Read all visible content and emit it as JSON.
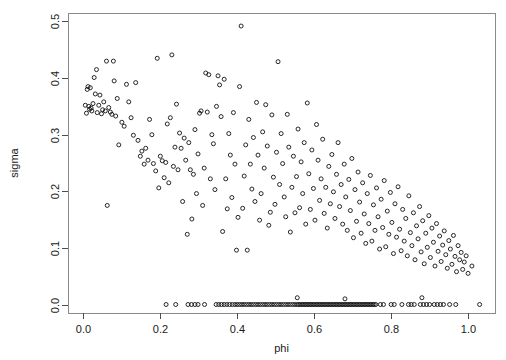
{
  "chart_data": {
    "type": "scatter",
    "title": "",
    "xlabel": "phi",
    "ylabel": "sigma",
    "xlim": [
      -0.04,
      1.07
    ],
    "ylim": [
      -0.015,
      0.515
    ],
    "xticks": [
      0.0,
      0.2,
      0.4,
      0.6,
      0.8,
      1.0
    ],
    "xtick_labels": [
      "0.0",
      "0.2",
      "0.4",
      "0.6",
      "0.8",
      "1.0"
    ],
    "yticks": [
      0.0,
      0.1,
      0.2,
      0.3,
      0.4,
      0.5
    ],
    "ytick_labels": [
      "0.0",
      "0.1",
      "0.2",
      "0.3",
      "0.4",
      "0.5"
    ],
    "grid": false,
    "legend": false,
    "marker": "open-circle",
    "marker_size": 4,
    "marker_color": "#111111",
    "n_points": 452,
    "points": [
      [
        0.005,
        0.352
      ],
      [
        0.008,
        0.338
      ],
      [
        0.01,
        0.38
      ],
      [
        0.012,
        0.385
      ],
      [
        0.014,
        0.35
      ],
      [
        0.016,
        0.345
      ],
      [
        0.018,
        0.383
      ],
      [
        0.02,
        0.347
      ],
      [
        0.022,
        0.342
      ],
      [
        0.025,
        0.355
      ],
      [
        0.028,
        0.401
      ],
      [
        0.031,
        0.372
      ],
      [
        0.034,
        0.415
      ],
      [
        0.036,
        0.339
      ],
      [
        0.04,
        0.352
      ],
      [
        0.043,
        0.37
      ],
      [
        0.047,
        0.337
      ],
      [
        0.05,
        0.344
      ],
      [
        0.053,
        0.358
      ],
      [
        0.057,
        0.342
      ],
      [
        0.06,
        0.43
      ],
      [
        0.062,
        0.175
      ],
      [
        0.066,
        0.348
      ],
      [
        0.07,
        0.34
      ],
      [
        0.074,
        0.336
      ],
      [
        0.078,
        0.43
      ],
      [
        0.08,
        0.395
      ],
      [
        0.084,
        0.333
      ],
      [
        0.088,
        0.364
      ],
      [
        0.092,
        0.282
      ],
      [
        0.1,
        0.322
      ],
      [
        0.106,
        0.315
      ],
      [
        0.112,
        0.389
      ],
      [
        0.118,
        0.358
      ],
      [
        0.124,
        0.33
      ],
      [
        0.13,
        0.299
      ],
      [
        0.136,
        0.392
      ],
      [
        0.142,
        0.29
      ],
      [
        0.148,
        0.262
      ],
      [
        0.152,
        0.271
      ],
      [
        0.158,
        0.248
      ],
      [
        0.162,
        0.276
      ],
      [
        0.168,
        0.255
      ],
      [
        0.172,
        0.327
      ],
      [
        0.178,
        0.3
      ],
      [
        0.182,
        0.249
      ],
      [
        0.188,
        0.236
      ],
      [
        0.192,
        0.435
      ],
      [
        0.196,
        0.206
      ],
      [
        0.2,
        0.262
      ],
      [
        0.205,
        0.254
      ],
      [
        0.21,
        0.224
      ],
      [
        0.214,
        0.251
      ],
      [
        0.218,
        0.319
      ],
      [
        0.222,
        0.215
      ],
      [
        0.226,
        0.33
      ],
      [
        0.23,
        0.441
      ],
      [
        0.234,
        0.244
      ],
      [
        0.238,
        0.278
      ],
      [
        0.242,
        0.354
      ],
      [
        0.246,
        0.238
      ],
      [
        0.25,
        0.303
      ],
      [
        0.254,
        0.276
      ],
      [
        0.258,
        0.182
      ],
      [
        0.262,
        0.294
      ],
      [
        0.266,
        0.255
      ],
      [
        0.27,
        0.124
      ],
      [
        0.274,
        0.286
      ],
      [
        0.278,
        0.238
      ],
      [
        0.282,
        0.151
      ],
      [
        0.286,
        0.23
      ],
      [
        0.29,
        0.309
      ],
      [
        0.294,
        0.196
      ],
      [
        0.298,
        0.266
      ],
      [
        0.302,
        0.338
      ],
      [
        0.306,
        0.342
      ],
      [
        0.31,
        0.175
      ],
      [
        0.314,
        0.241
      ],
      [
        0.318,
        0.409
      ],
      [
        0.322,
        0.34
      ],
      [
        0.326,
        0.406
      ],
      [
        0.33,
        0.222
      ],
      [
        0.334,
        0.3
      ],
      [
        0.338,
        0.284
      ],
      [
        0.342,
        0.203
      ],
      [
        0.346,
        0.35
      ],
      [
        0.35,
        0.404
      ],
      [
        0.354,
        0.388
      ],
      [
        0.358,
        0.332
      ],
      [
        0.362,
        0.129
      ],
      [
        0.366,
        0.398
      ],
      [
        0.37,
        0.222
      ],
      [
        0.374,
        0.169
      ],
      [
        0.378,
        0.302
      ],
      [
        0.382,
        0.264
      ],
      [
        0.386,
        0.189
      ],
      [
        0.39,
        0.339
      ],
      [
        0.394,
        0.248
      ],
      [
        0.398,
        0.096
      ],
      [
        0.402,
        0.154
      ],
      [
        0.406,
        0.385
      ],
      [
        0.41,
        0.492
      ],
      [
        0.414,
        0.17
      ],
      [
        0.418,
        0.227
      ],
      [
        0.422,
        0.282
      ],
      [
        0.426,
        0.096
      ],
      [
        0.43,
        0.327
      ],
      [
        0.434,
        0.248
      ],
      [
        0.438,
        0.204
      ],
      [
        0.442,
        0.295
      ],
      [
        0.446,
        0.182
      ],
      [
        0.45,
        0.357
      ],
      [
        0.454,
        0.264
      ],
      [
        0.458,
        0.149
      ],
      [
        0.462,
        0.196
      ],
      [
        0.466,
        0.305
      ],
      [
        0.47,
        0.241
      ],
      [
        0.474,
        0.353
      ],
      [
        0.478,
        0.28
      ],
      [
        0.482,
        0.14
      ],
      [
        0.486,
        0.163
      ],
      [
        0.49,
        0.335
      ],
      [
        0.494,
        0.225
      ],
      [
        0.498,
        0.177
      ],
      [
        0.502,
        0.269
      ],
      [
        0.506,
        0.429
      ],
      [
        0.51,
        0.212
      ],
      [
        0.514,
        0.302
      ],
      [
        0.518,
        0.249
      ],
      [
        0.522,
        0.19
      ],
      [
        0.526,
        0.155
      ],
      [
        0.53,
        0.336
      ],
      [
        0.534,
        0.278
      ],
      [
        0.538,
        0.128
      ],
      [
        0.542,
        0.207
      ],
      [
        0.546,
        0.262
      ],
      [
        0.55,
        0.162
      ],
      [
        0.554,
        0.226
      ],
      [
        0.558,
        0.31
      ],
      [
        0.562,
        0.171
      ],
      [
        0.566,
        0.252
      ],
      [
        0.57,
        0.196
      ],
      [
        0.574,
        0.286
      ],
      [
        0.578,
        0.142
      ],
      [
        0.582,
        0.356
      ],
      [
        0.586,
        0.231
      ],
      [
        0.59,
        0.168
      ],
      [
        0.594,
        0.273
      ],
      [
        0.598,
        0.205
      ],
      [
        0.602,
        0.149
      ],
      [
        0.606,
        0.318
      ],
      [
        0.61,
        0.255
      ],
      [
        0.614,
        0.184
      ],
      [
        0.618,
        0.222
      ],
      [
        0.622,
        0.292
      ],
      [
        0.626,
        0.161
      ],
      [
        0.63,
        0.207
      ],
      [
        0.634,
        0.135
      ],
      [
        0.638,
        0.244
      ],
      [
        0.642,
        0.178
      ],
      [
        0.646,
        0.265
      ],
      [
        0.65,
        0.199
      ],
      [
        0.654,
        0.152
      ],
      [
        0.658,
        0.23
      ],
      [
        0.662,
        0.286
      ],
      [
        0.666,
        0.173
      ],
      [
        0.67,
        0.212
      ],
      [
        0.674,
        0.142
      ],
      [
        0.678,
        0.248
      ],
      [
        0.682,
        0.19
      ],
      [
        0.686,
        0.131
      ],
      [
        0.69,
        0.221
      ],
      [
        0.694,
        0.166
      ],
      [
        0.698,
        0.258
      ],
      [
        0.702,
        0.118
      ],
      [
        0.706,
        0.203
      ],
      [
        0.71,
        0.147
      ],
      [
        0.714,
        0.234
      ],
      [
        0.718,
        0.181
      ],
      [
        0.722,
        0.126
      ],
      [
        0.726,
        0.215
      ],
      [
        0.73,
        0.16
      ],
      [
        0.734,
        0.108
      ],
      [
        0.738,
        0.196
      ],
      [
        0.742,
        0.143
      ],
      [
        0.746,
        0.228
      ],
      [
        0.75,
        0.112
      ],
      [
        0.754,
        0.176
      ],
      [
        0.758,
        0.131
      ],
      [
        0.762,
        0.206
      ],
      [
        0.766,
        0.155
      ],
      [
        0.77,
        0.098
      ],
      [
        0.774,
        0.186
      ],
      [
        0.778,
        0.136
      ],
      [
        0.782,
        0.219
      ],
      [
        0.786,
        0.102
      ],
      [
        0.79,
        0.165
      ],
      [
        0.794,
        0.124
      ],
      [
        0.798,
        0.198
      ],
      [
        0.802,
        0.145
      ],
      [
        0.806,
        0.09
      ],
      [
        0.81,
        0.178
      ],
      [
        0.814,
        0.119
      ],
      [
        0.818,
        0.208
      ],
      [
        0.822,
        0.133
      ],
      [
        0.826,
        0.095
      ],
      [
        0.83,
        0.168
      ],
      [
        0.834,
        0.112
      ],
      [
        0.838,
        0.152
      ],
      [
        0.842,
        0.086
      ],
      [
        0.846,
        0.192
      ],
      [
        0.85,
        0.127
      ],
      [
        0.854,
        0.104
      ],
      [
        0.858,
        0.162
      ],
      [
        0.862,
        0.079
      ],
      [
        0.866,
        0.139
      ],
      [
        0.87,
        0.116
      ],
      [
        0.874,
        0.173
      ],
      [
        0.878,
        0.093
      ],
      [
        0.882,
        0.148
      ],
      [
        0.886,
        0.072
      ],
      [
        0.89,
        0.126
      ],
      [
        0.894,
        0.101
      ],
      [
        0.898,
        0.157
      ],
      [
        0.902,
        0.083
      ],
      [
        0.906,
        0.135
      ],
      [
        0.91,
        0.11
      ],
      [
        0.914,
        0.068
      ],
      [
        0.918,
        0.143
      ],
      [
        0.922,
        0.094
      ],
      [
        0.926,
        0.121
      ],
      [
        0.93,
        0.076
      ],
      [
        0.934,
        0.105
      ],
      [
        0.938,
        0.13
      ],
      [
        0.942,
        0.088
      ],
      [
        0.946,
        0.064
      ],
      [
        0.95,
        0.113
      ],
      [
        0.954,
        0.098
      ],
      [
        0.958,
        0.071
      ],
      [
        0.962,
        0.122
      ],
      [
        0.966,
        0.085
      ],
      [
        0.97,
        0.058
      ],
      [
        0.974,
        0.104
      ],
      [
        0.978,
        0.079
      ],
      [
        0.982,
        0.092
      ],
      [
        0.986,
        0.062
      ],
      [
        0.99,
        0.075
      ],
      [
        0.995,
        0.086
      ],
      [
        1.0,
        0.055
      ],
      [
        1.01,
        0.068
      ],
      [
        0.215,
        0.0
      ],
      [
        0.24,
        0.0
      ],
      [
        0.272,
        0.0
      ],
      [
        0.281,
        0.0
      ],
      [
        0.29,
        0.0
      ],
      [
        0.298,
        0.0
      ],
      [
        0.315,
        0.0
      ],
      [
        0.345,
        0.0
      ],
      [
        0.352,
        0.0
      ],
      [
        0.359,
        0.0
      ],
      [
        0.366,
        0.0
      ],
      [
        0.373,
        0.0
      ],
      [
        0.38,
        0.0
      ],
      [
        0.387,
        0.0
      ],
      [
        0.394,
        0.0
      ],
      [
        0.4,
        0.0
      ],
      [
        0.406,
        0.0
      ],
      [
        0.412,
        0.0
      ],
      [
        0.418,
        0.0
      ],
      [
        0.424,
        0.0
      ],
      [
        0.43,
        0.0
      ],
      [
        0.436,
        0.0
      ],
      [
        0.442,
        0.0
      ],
      [
        0.448,
        0.0
      ],
      [
        0.454,
        0.0
      ],
      [
        0.46,
        0.0
      ],
      [
        0.466,
        0.0
      ],
      [
        0.472,
        0.0
      ],
      [
        0.478,
        0.0
      ],
      [
        0.484,
        0.0
      ],
      [
        0.49,
        0.0
      ],
      [
        0.496,
        0.0
      ],
      [
        0.502,
        0.0
      ],
      [
        0.508,
        0.0
      ],
      [
        0.514,
        0.0
      ],
      [
        0.52,
        0.0
      ],
      [
        0.526,
        0.0
      ],
      [
        0.532,
        0.0
      ],
      [
        0.538,
        0.0
      ],
      [
        0.544,
        0.0
      ],
      [
        0.55,
        0.0
      ],
      [
        0.556,
        0.0
      ],
      [
        0.56,
        0.0
      ],
      [
        0.564,
        0.0
      ],
      [
        0.568,
        0.0
      ],
      [
        0.572,
        0.0
      ],
      [
        0.576,
        0.0
      ],
      [
        0.58,
        0.0
      ],
      [
        0.584,
        0.0
      ],
      [
        0.588,
        0.0
      ],
      [
        0.592,
        0.0
      ],
      [
        0.596,
        0.0
      ],
      [
        0.6,
        0.0
      ],
      [
        0.604,
        0.0
      ],
      [
        0.608,
        0.0
      ],
      [
        0.612,
        0.0
      ],
      [
        0.616,
        0.0
      ],
      [
        0.62,
        0.0
      ],
      [
        0.624,
        0.0
      ],
      [
        0.628,
        0.0
      ],
      [
        0.632,
        0.0
      ],
      [
        0.636,
        0.0
      ],
      [
        0.64,
        0.0
      ],
      [
        0.644,
        0.0
      ],
      [
        0.648,
        0.0
      ],
      [
        0.652,
        0.0
      ],
      [
        0.656,
        0.0
      ],
      [
        0.66,
        0.0
      ],
      [
        0.664,
        0.0
      ],
      [
        0.668,
        0.0
      ],
      [
        0.672,
        0.0
      ],
      [
        0.676,
        0.0
      ],
      [
        0.68,
        0.0
      ],
      [
        0.684,
        0.0
      ],
      [
        0.688,
        0.0
      ],
      [
        0.692,
        0.0
      ],
      [
        0.696,
        0.0
      ],
      [
        0.7,
        0.0
      ],
      [
        0.704,
        0.0
      ],
      [
        0.708,
        0.0
      ],
      [
        0.712,
        0.0
      ],
      [
        0.716,
        0.0
      ],
      [
        0.72,
        0.0
      ],
      [
        0.724,
        0.0
      ],
      [
        0.728,
        0.0
      ],
      [
        0.732,
        0.0
      ],
      [
        0.736,
        0.0
      ],
      [
        0.74,
        0.0
      ],
      [
        0.744,
        0.0
      ],
      [
        0.748,
        0.0
      ],
      [
        0.752,
        0.0
      ],
      [
        0.756,
        0.0
      ],
      [
        0.76,
        0.0
      ],
      [
        0.772,
        0.0
      ],
      [
        0.78,
        0.0
      ],
      [
        0.8,
        0.0
      ],
      [
        0.808,
        0.0
      ],
      [
        0.828,
        0.0
      ],
      [
        0.845,
        0.0
      ],
      [
        0.852,
        0.0
      ],
      [
        0.86,
        0.0
      ],
      [
        0.876,
        0.0
      ],
      [
        0.884,
        0.0
      ],
      [
        0.892,
        0.0
      ],
      [
        0.9,
        0.0
      ],
      [
        0.912,
        0.0
      ],
      [
        0.92,
        0.0
      ],
      [
        0.928,
        0.0
      ],
      [
        0.936,
        0.0
      ],
      [
        0.952,
        0.0
      ],
      [
        0.968,
        0.0
      ],
      [
        1.03,
        0.0
      ],
      [
        0.88,
        0.012
      ],
      [
        0.556,
        0.012
      ],
      [
        0.68,
        0.01
      ]
    ]
  }
}
